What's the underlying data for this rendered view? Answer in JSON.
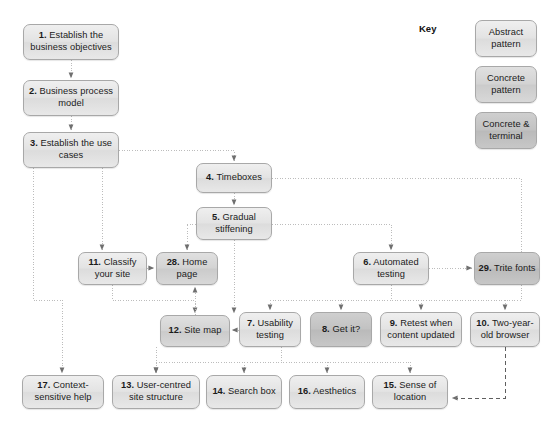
{
  "diagram": {
    "key": {
      "label": "Key",
      "items": [
        {
          "id": "key-abstract",
          "text": "Abstract pattern",
          "style": "abstract"
        },
        {
          "id": "key-concrete",
          "text": "Concrete pattern",
          "style": "concrete"
        },
        {
          "id": "key-terminal",
          "text": "Concrete & terminal",
          "style": "terminal"
        }
      ]
    },
    "colors": {
      "abstract_fill": "#e3e3e3",
      "concrete_fill": "#d3d3d3",
      "terminal_fill": "#c2c2c2",
      "border": "#a8a8a8",
      "connector": "#b9b9b9",
      "text": "#1b1b1b",
      "background": "#ffffff"
    },
    "nodes": [
      {
        "id": "n1",
        "num": "1.",
        "text": "Establish the business objectives",
        "style": "abstract",
        "x": 23,
        "y": 24,
        "w": 96,
        "h": 36
      },
      {
        "id": "n2",
        "num": "2.",
        "text": "Business process model",
        "style": "abstract",
        "x": 23,
        "y": 80,
        "w": 96,
        "h": 36
      },
      {
        "id": "n3",
        "num": "3.",
        "text": "Establish the use cases",
        "style": "abstract",
        "x": 23,
        "y": 132,
        "w": 96,
        "h": 36
      },
      {
        "id": "n4",
        "num": "4.",
        "text": "Timeboxes",
        "style": "abstract",
        "x": 196,
        "y": 163,
        "w": 76,
        "h": 30
      },
      {
        "id": "n5",
        "num": "5.",
        "text": "Gradual stiffening",
        "style": "abstract",
        "x": 196,
        "y": 207,
        "w": 76,
        "h": 33
      },
      {
        "id": "n6",
        "num": "6.",
        "text": "Automated testing",
        "style": "abstract",
        "x": 353,
        "y": 252,
        "w": 76,
        "h": 33
      },
      {
        "id": "n29",
        "num": "29.",
        "text": "Trite fonts",
        "style": "terminal",
        "x": 474,
        "y": 252,
        "w": 66,
        "h": 33
      },
      {
        "id": "n11",
        "num": "11.",
        "text": "Classify your site",
        "style": "abstract",
        "x": 78,
        "y": 252,
        "w": 69,
        "h": 33
      },
      {
        "id": "n28",
        "num": "28.",
        "text": "Home page",
        "style": "concrete",
        "x": 156,
        "y": 252,
        "w": 62,
        "h": 33
      },
      {
        "id": "n12",
        "num": "12.",
        "text": "Site map",
        "style": "concrete",
        "x": 160,
        "y": 315,
        "w": 70,
        "h": 32
      },
      {
        "id": "n7",
        "num": "7.",
        "text": "Usability testing",
        "style": "abstract",
        "x": 239,
        "y": 312,
        "w": 62,
        "h": 35
      },
      {
        "id": "n8",
        "num": "8.",
        "text": "Get it?",
        "style": "terminal",
        "x": 310,
        "y": 312,
        "w": 62,
        "h": 35
      },
      {
        "id": "n9",
        "num": "9.",
        "text": "Retest when content updated",
        "style": "abstract",
        "x": 380,
        "y": 312,
        "w": 82,
        "h": 35
      },
      {
        "id": "n10",
        "num": "10.",
        "text": "Two-year-old browser",
        "style": "abstract",
        "x": 470,
        "y": 312,
        "w": 70,
        "h": 35
      },
      {
        "id": "n17",
        "num": "17.",
        "text": "Context-sensitive help",
        "style": "abstract",
        "x": 22,
        "y": 375,
        "w": 82,
        "h": 34
      },
      {
        "id": "n13",
        "num": "13.",
        "text": "User-centred site structure",
        "style": "abstract",
        "x": 112,
        "y": 375,
        "w": 88,
        "h": 34
      },
      {
        "id": "n14",
        "num": "14.",
        "text": "Search box",
        "style": "abstract",
        "x": 206,
        "y": 375,
        "w": 76,
        "h": 34
      },
      {
        "id": "n16",
        "num": "16.",
        "text": "Aesthetics",
        "style": "abstract",
        "x": 289,
        "y": 375,
        "w": 76,
        "h": 34
      },
      {
        "id": "n15",
        "num": "15.",
        "text": "Sense of location",
        "style": "abstract",
        "x": 372,
        "y": 375,
        "w": 76,
        "h": 34
      }
    ],
    "connections": [
      {
        "from": "n1",
        "to": "n2",
        "kind": "dotted"
      },
      {
        "from": "n2",
        "to": "n3",
        "kind": "dotted"
      },
      {
        "from": "n3",
        "to": "n4",
        "kind": "dotted"
      },
      {
        "from": "n3",
        "to": "n11",
        "kind": "dotted"
      },
      {
        "from": "n3",
        "to": "n17",
        "kind": "dotted"
      },
      {
        "from": "n4",
        "to": "n5",
        "kind": "dotted"
      },
      {
        "from": "n4",
        "to": "bus",
        "kind": "dotted"
      },
      {
        "from": "n5",
        "to": "n28",
        "kind": "dotted"
      },
      {
        "from": "n5",
        "to": "n6",
        "kind": "dotted"
      },
      {
        "from": "n5",
        "to": "n12",
        "kind": "dotted"
      },
      {
        "from": "n6",
        "to": "n29",
        "kind": "dotted"
      },
      {
        "from": "n6",
        "to": "bus",
        "kind": "dotted"
      },
      {
        "from": "n11",
        "to": "n28",
        "kind": "dotted"
      },
      {
        "from": "n11",
        "to": "n12",
        "kind": "dotted"
      },
      {
        "from": "n7",
        "to": "n12",
        "kind": "dotted"
      },
      {
        "from": "n12",
        "to": "n28",
        "kind": "dotted"
      },
      {
        "from": "n12",
        "to": "n13",
        "kind": "dotted"
      },
      {
        "from": "bus",
        "to": "n7",
        "kind": "dotted"
      },
      {
        "from": "bus",
        "to": "n8",
        "kind": "dotted"
      },
      {
        "from": "bus",
        "to": "n9",
        "kind": "dotted"
      },
      {
        "from": "bus",
        "to": "n10",
        "kind": "dotted"
      },
      {
        "from": "bus2",
        "to": "n13",
        "kind": "dotted"
      },
      {
        "from": "bus2",
        "to": "n14",
        "kind": "dotted"
      },
      {
        "from": "bus2",
        "to": "n16",
        "kind": "dotted"
      },
      {
        "from": "bus2",
        "to": "n15",
        "kind": "dotted"
      },
      {
        "from": "n10",
        "to": "n15",
        "kind": "dashed"
      }
    ]
  }
}
